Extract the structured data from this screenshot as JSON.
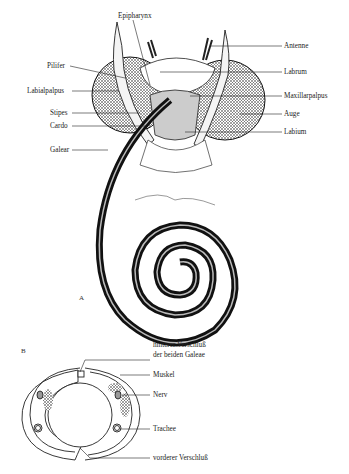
{
  "figure_a": {
    "panel_label": "A",
    "labels": {
      "epipharynx": "Epipharynx",
      "antenne": "Antenne",
      "pilifer": "Pilifer",
      "labrum": "Labrum",
      "labialpalpus": "Labialpalpus",
      "maxillarpalpus": "Maxillarpalpus",
      "auge": "Auge",
      "stipes": "Stipes",
      "cardo": "Cardo",
      "labium": "Labium",
      "galear": "Galear"
    }
  },
  "figure_b": {
    "panel_label": "B",
    "labels": {
      "hinterer_line1": "hinterer Verschluß",
      "hinterer_line2": "der beiden Galeae",
      "muskel": "Muskel",
      "nerv": "Nerv",
      "trachee": "Trachee",
      "vorderer": "vorderer Verschluß"
    }
  }
}
